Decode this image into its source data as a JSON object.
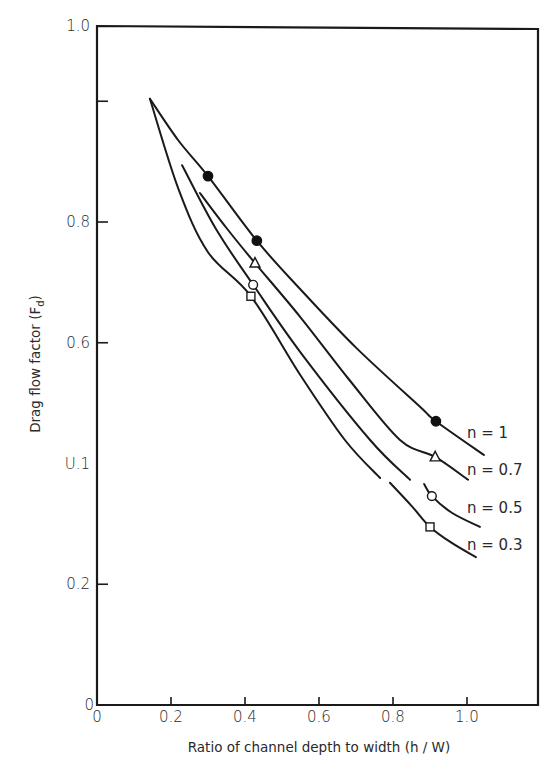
{
  "chart_data": {
    "type": "line",
    "title": "",
    "xlabel": "Ratio of channel depth to width (h / W)",
    "ylabel_main": "Drag flow factor (F",
    "ylabel_sub": "d",
    "ylabel_close": ")",
    "xlim": [
      0,
      1.2
    ],
    "ylim": [
      0,
      1.12
    ],
    "grid": false,
    "legend_position": "inline-right",
    "x_ticks": [
      {
        "value": 0,
        "label": "0"
      },
      {
        "value": 0.2,
        "label": "0.2"
      },
      {
        "value": 0.4,
        "label": "0.4"
      },
      {
        "value": 0.6,
        "label": "0.6"
      },
      {
        "value": 0.8,
        "label": "0.8"
      },
      {
        "value": 1.0,
        "label": "1.0"
      }
    ],
    "y_ticks": [
      {
        "value": 0,
        "label": "0",
        "tick": false
      },
      {
        "value": 0.2,
        "label": "0.2",
        "tick": true
      },
      {
        "value": 0.4,
        "label": "U.1",
        "tick": false
      },
      {
        "value": 0.6,
        "label": "0.6",
        "tick": true
      },
      {
        "value": 0.8,
        "label": "0.8",
        "tick": true
      },
      {
        "value": 1.0,
        "label": "",
        "tick": true
      }
    ],
    "y_top_label": "1.0",
    "series": [
      {
        "name": "n = 1",
        "n": 1,
        "marker": "filled-circle",
        "curve_segments": [
          [
            [
              0.143,
              1.004
            ],
            [
              0.22,
              0.935
            ],
            [
              0.3,
              0.876
            ],
            [
              0.432,
              0.769
            ],
            [
              0.549,
              0.689
            ],
            [
              0.7,
              0.592
            ],
            [
              0.873,
              0.494
            ],
            [
              0.916,
              0.47
            ],
            [
              1.046,
              0.414
            ]
          ]
        ],
        "points": [
          [
            0.3,
            0.876
          ],
          [
            0.432,
            0.769
          ],
          [
            0.916,
            0.47
          ]
        ],
        "label_pos": [
          467,
          438
        ]
      },
      {
        "name": "n = 0.7",
        "n": 0.7,
        "marker": "open-triangle",
        "curve_segments": [
          [
            [
              0.278,
              0.848
            ],
            [
              0.35,
              0.79
            ],
            [
              0.427,
              0.732
            ],
            [
              0.549,
              0.643
            ],
            [
              0.68,
              0.54
            ],
            [
              0.819,
              0.439
            ],
            [
              0.914,
              0.411
            ],
            [
              1.003,
              0.373
            ]
          ]
        ],
        "points": [
          [
            0.427,
            0.732
          ],
          [
            0.914,
            0.411
          ]
        ],
        "label_pos": [
          467,
          475
        ]
      },
      {
        "name": "n = 0.5",
        "n": 0.5,
        "marker": "open-circle",
        "curve_segments": [
          [
            [
              0.23,
              0.894
            ],
            [
              0.32,
              0.79
            ],
            [
              0.422,
              0.696
            ],
            [
              0.549,
              0.585
            ],
            [
              0.738,
              0.439
            ],
            [
              0.846,
              0.373
            ]
          ],
          [
            [
              0.884,
              0.366
            ],
            [
              0.905,
              0.346
            ],
            [
              0.96,
              0.318
            ],
            [
              1.035,
              0.295
            ]
          ]
        ],
        "points": [
          [
            0.422,
            0.696
          ],
          [
            0.905,
            0.346
          ]
        ],
        "label_pos": [
          467,
          513
        ]
      },
      {
        "name": "n = 0.3",
        "n": 0.3,
        "marker": "open-square",
        "curve_segments": [
          [
            [
              0.143,
              1.004
            ],
            [
              0.22,
              0.855
            ],
            [
              0.3,
              0.75
            ],
            [
              0.416,
              0.677
            ],
            [
              0.549,
              0.547
            ],
            [
              0.67,
              0.439
            ],
            [
              0.765,
              0.376
            ]
          ],
          [
            [
              0.792,
              0.368
            ],
            [
              0.85,
              0.33
            ],
            [
              0.9,
              0.295
            ],
            [
              0.96,
              0.268
            ],
            [
              1.024,
              0.245
            ]
          ]
        ],
        "points": [
          [
            0.416,
            0.677
          ],
          [
            0.9,
            0.295
          ]
        ],
        "label_pos": [
          467,
          550
        ]
      }
    ]
  }
}
